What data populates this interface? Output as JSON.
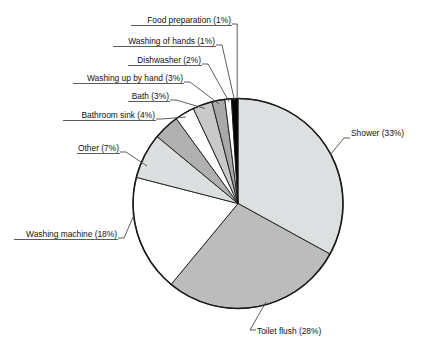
{
  "chart_data": {
    "type": "pie",
    "title": "",
    "subtitle": "",
    "xlabel": "",
    "ylabel": "",
    "units": "%",
    "legend_position": "none",
    "grid": false,
    "start_angle_deg": 0,
    "direction": "clockwise",
    "categories": [
      "Shower",
      "Toilet flush",
      "Washing machine",
      "Other",
      "Bathroom sink",
      "Bath",
      "Washing up by hand",
      "Dishwasher",
      "Washing of hands",
      "Food preparation"
    ],
    "values": [
      33,
      28,
      18,
      7,
      4,
      3,
      3,
      2,
      1,
      1
    ],
    "slice_colors": [
      "#dde0e0",
      "#bcbcbc",
      "#ffffff",
      "#dcdfdf",
      "#b0b0b0",
      "#ffffff",
      "#c9c9c9",
      "#a9a9a9",
      "#ffffff",
      "#050505"
    ],
    "slices": [
      {
        "label": "Shower",
        "value": 33,
        "text": "Shower (33%)",
        "color": "#dde0e0"
      },
      {
        "label": "Toilet flush",
        "value": 28,
        "text": "Toilet flush (28%)",
        "color": "#bcbcbc"
      },
      {
        "label": "Washing machine",
        "value": 18,
        "text": "Washing machine (18%)",
        "color": "#ffffff"
      },
      {
        "label": "Other",
        "value": 7,
        "text": "Other (7%)",
        "color": "#dcdfdf"
      },
      {
        "label": "Bathroom sink",
        "value": 4,
        "text": "Bathroom sink (4%)",
        "color": "#b0b0b0"
      },
      {
        "label": "Bath",
        "value": 3,
        "text": "Bath (3%)",
        "color": "#ffffff"
      },
      {
        "label": "Washing up by hand",
        "value": 3,
        "text": "Washing up by hand (3%)",
        "color": "#c9c9c9"
      },
      {
        "label": "Dishwasher",
        "value": 2,
        "text": "Dishwasher (2%)",
        "color": "#a9a9a9"
      },
      {
        "label": "Washing of hands",
        "value": 1,
        "text": "Washing of hands (1%)",
        "color": "#ffffff"
      },
      {
        "label": "Food preparation",
        "value": 1,
        "text": "Food preparation (1%)",
        "color": "#050505"
      }
    ]
  },
  "labels": {
    "food_preparation": "Food preparation (1%)",
    "washing_of_hands": "Washing of hands (1%)",
    "dishwasher": "Dishwasher (2%)",
    "washing_up_by_hand": "Washing up by hand (3%)",
    "bath": "Bath (3%)",
    "bathroom_sink": "Bathroom sink (4%)",
    "other": "Other (7%)",
    "washing_machine": "Washing machine (18%)",
    "toilet_flush": "Toilet flush (28%)",
    "shower": "Shower (33%)"
  },
  "colors": {
    "outline": "#1a1a1a",
    "leader": "#4a4a4a",
    "text": "#111111",
    "background": "#ffffff"
  }
}
